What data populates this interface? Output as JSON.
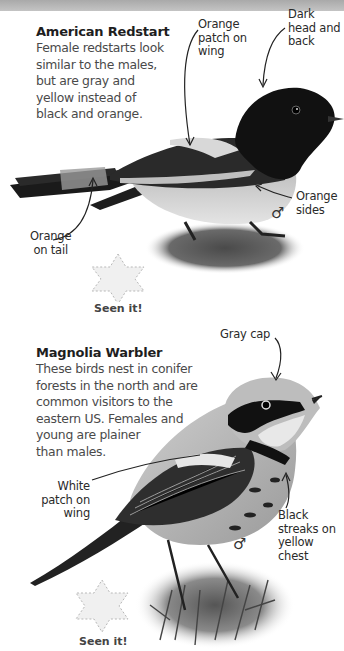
{
  "page": {
    "top_band_color": "#b5b5b5",
    "background": "#ffffff"
  },
  "birds": [
    {
      "name": "American Redstart",
      "description": "Female redstarts look\nsimilar to the males,\nbut are gray and\nyellow instead of\nblack and orange.",
      "sex_symbol": "♂",
      "annotations": [
        {
          "id": "wing",
          "text": "Orange\npatch on\nwing"
        },
        {
          "id": "head",
          "text": "Dark\nhead and\nback"
        },
        {
          "id": "sides",
          "text": "Orange\nsides"
        },
        {
          "id": "tail",
          "text": "Orange\non tail"
        }
      ],
      "checkbox_icon": "star-icon",
      "checkbox_label": "Seen it!"
    },
    {
      "name": "Magnolia Warbler",
      "description": "These birds nest in conifer\nforests in the north and are\ncommon visitors to the\neastern US.  Females and\nyoung are plainer\nthan males.",
      "sex_symbol": "♂",
      "annotations": [
        {
          "id": "cap",
          "text": "Gray cap"
        },
        {
          "id": "wing",
          "text": "White\npatch on\nwing"
        },
        {
          "id": "chest",
          "text": "Black\nstreaks on\nyellow chest"
        }
      ],
      "checkbox_icon": "star-icon",
      "checkbox_label": "Seen it!"
    }
  ]
}
